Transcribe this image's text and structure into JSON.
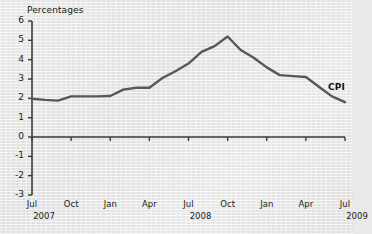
{
  "chart_data": {
    "type": "line",
    "title": "",
    "ylabel": "Percentages",
    "xlabel": "",
    "ylim": [
      -3,
      6
    ],
    "y_ticks": [
      6,
      5,
      4,
      3,
      2,
      1,
      0,
      -1,
      -2,
      -3
    ],
    "y_tick_labels": [
      "6",
      "5",
      "4",
      "3",
      "2",
      "1",
      "0",
      "-1",
      "-2",
      "-3"
    ],
    "grid": false,
    "legend": "inline-right",
    "x_tick_labels": [
      "Jul",
      "Oct",
      "Jan",
      "Apr",
      "Jul",
      "Oct",
      "Jan",
      "Apr",
      "Jul"
    ],
    "x_year_labels": [
      "2007",
      "2008",
      "2009"
    ],
    "x_year_positions": [
      0,
      4,
      8
    ],
    "series": [
      {
        "name": "CPI",
        "color": "#575757",
        "x": [
          "Jul 2007",
          "Aug 2007",
          "Sep 2007",
          "Oct 2007",
          "Nov 2007",
          "Dec 2007",
          "Jan 2008",
          "Feb 2008",
          "Mar 2008",
          "Apr 2008",
          "May 2008",
          "Jun 2008",
          "Jul 2008",
          "Aug 2008",
          "Sep 2008",
          "Oct 2008",
          "Nov 2008",
          "Dec 2008",
          "Jan 2009",
          "Feb 2009",
          "Mar 2009",
          "Apr 2009",
          "May 2009",
          "Jun 2009",
          "Jul 2009"
        ],
        "values": [
          1.98,
          1.92,
          1.88,
          2.1,
          2.1,
          2.1,
          2.12,
          2.45,
          2.55,
          2.55,
          3.05,
          3.4,
          3.8,
          4.4,
          4.7,
          5.2,
          4.5,
          4.1,
          3.6,
          3.2,
          3.15,
          3.1,
          2.6,
          2.1,
          1.8
        ]
      }
    ],
    "annotations": [
      {
        "text": "CPI",
        "x": "Jun 2009",
        "y": 2.55
      }
    ]
  },
  "axis": {
    "y_axis_title": "Percentages"
  }
}
